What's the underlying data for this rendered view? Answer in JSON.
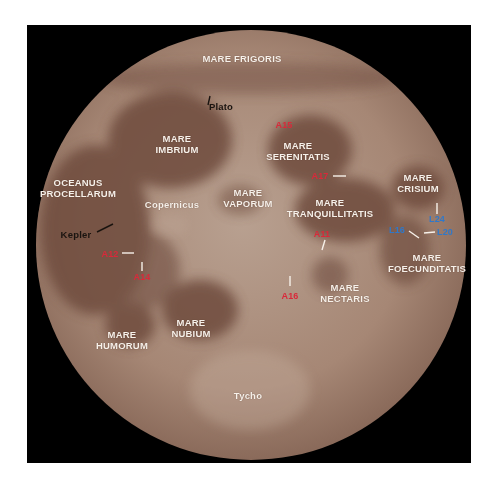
{
  "figure": {
    "background": "#ffffff",
    "panel_color": "#000000",
    "moon_base_color": "#a88a78",
    "mare_color": "#6e4c3e"
  },
  "labels": {
    "mare_frigoris": "MARE FRIGORIS",
    "plato": "Plato",
    "mare_imbrium_1": "MARE",
    "mare_imbrium_2": "IMBRIUM",
    "mare_serenitatis_1": "MARE",
    "mare_serenitatis_2": "SERENITATIS",
    "oceanus_procellarum_1": "OCEANUS",
    "oceanus_procellarum_2": "PROCELLARUM",
    "copernicus": "Copernicus",
    "mare_vaporum_1": "MARE",
    "mare_vaporum_2": "VAPORUM",
    "mare_crisium_1": "MARE",
    "mare_crisium_2": "CRISIUM",
    "mare_tranquillitatis_1": "MARE",
    "mare_tranquillitatis_2": "TRANQUILLITATIS",
    "kepler": "Kepler",
    "mare_foecunditatis_1": "MARE",
    "mare_foecunditatis_2": "FOECUNDITATIS",
    "mare_nectaris_1": "MARE",
    "mare_nectaris_2": "NECTARIS",
    "mare_nubium_1": "MARE",
    "mare_nubium_2": "NUBIUM",
    "mare_humorum_1": "MARE",
    "mare_humorum_2": "HUMORUM",
    "tycho": "Tycho"
  },
  "landing_sites": {
    "apollo": {
      "color": "#d9293a",
      "sites": [
        "A15",
        "A17",
        "A11",
        "A12",
        "A14",
        "A16"
      ]
    },
    "luna": {
      "color": "#2f78c9",
      "sites": [
        "L24",
        "L16",
        "L20"
      ]
    }
  }
}
